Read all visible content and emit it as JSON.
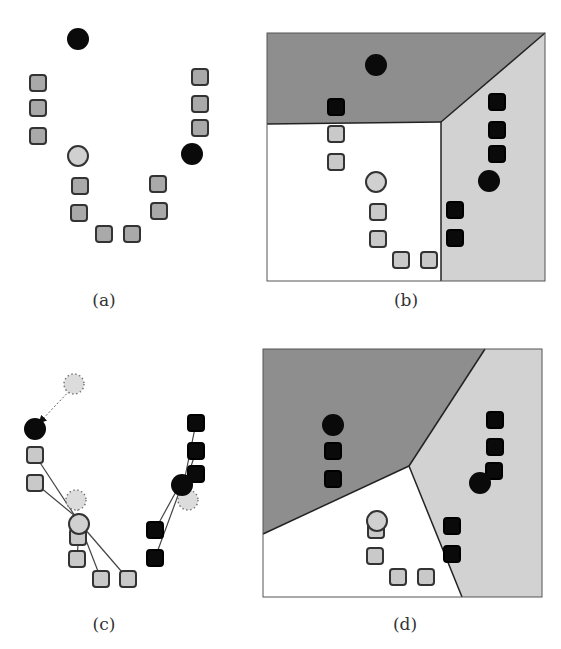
{
  "colors": {
    "dark_region": "#8e8e8e",
    "light_region": "#d2d2d2",
    "white_region": "#ffffff",
    "black_point": "#0a0a0a",
    "gray_square_a": "#a9a9a9",
    "light_square": "#c9c9c9",
    "light_circle": "#d0d0d0",
    "outline": "#333333"
  },
  "panels": [
    {
      "id": "a",
      "caption": "(a)",
      "caption_pos": [
        104,
        300
      ],
      "regions": [],
      "points": [
        {
          "shape": "circle",
          "style": "black",
          "x": 78,
          "y": 39
        },
        {
          "shape": "square",
          "style": "gray",
          "x": 38,
          "y": 83
        },
        {
          "shape": "square",
          "style": "gray",
          "x": 38,
          "y": 108
        },
        {
          "shape": "square",
          "style": "gray",
          "x": 38,
          "y": 136
        },
        {
          "shape": "circle",
          "style": "light",
          "x": 78,
          "y": 156
        },
        {
          "shape": "square",
          "style": "gray",
          "x": 80,
          "y": 186
        },
        {
          "shape": "square",
          "style": "gray",
          "x": 79,
          "y": 213
        },
        {
          "shape": "square",
          "style": "gray",
          "x": 104,
          "y": 234
        },
        {
          "shape": "square",
          "style": "gray",
          "x": 132,
          "y": 234
        },
        {
          "shape": "square",
          "style": "gray",
          "x": 158,
          "y": 184
        },
        {
          "shape": "square",
          "style": "gray",
          "x": 159,
          "y": 211
        },
        {
          "shape": "square",
          "style": "gray",
          "x": 200,
          "y": 77
        },
        {
          "shape": "square",
          "style": "gray",
          "x": 200,
          "y": 104
        },
        {
          "shape": "square",
          "style": "gray",
          "x": 200,
          "y": 128
        },
        {
          "shape": "circle",
          "style": "black",
          "x": 192,
          "y": 154
        }
      ],
      "lines": []
    },
    {
      "id": "b",
      "caption": "(b)",
      "caption_pos": [
        406,
        300
      ],
      "box": [
        267,
        33,
        545,
        281
      ],
      "regions": [
        {
          "fill": "dark",
          "points": [
            [
              267,
              33
            ],
            [
              545,
              33
            ],
            [
              441,
              122
            ],
            [
              267,
              124
            ]
          ]
        },
        {
          "fill": "light",
          "points": [
            [
              441,
              122
            ],
            [
              545,
              33
            ],
            [
              545,
              281
            ],
            [
              441,
              281
            ]
          ]
        }
      ],
      "borders": [
        [
          [
            267,
            124
          ],
          [
            441,
            122
          ]
        ],
        [
          [
            441,
            122
          ],
          [
            545,
            33
          ]
        ],
        [
          [
            441,
            122
          ],
          [
            441,
            281
          ]
        ]
      ],
      "points": [
        {
          "shape": "circle",
          "style": "black",
          "x": 376,
          "y": 65
        },
        {
          "shape": "square",
          "style": "black",
          "x": 336,
          "y": 107
        },
        {
          "shape": "square",
          "style": "light",
          "x": 336,
          "y": 134
        },
        {
          "shape": "square",
          "style": "light",
          "x": 336,
          "y": 162
        },
        {
          "shape": "circle",
          "style": "light",
          "x": 376,
          "y": 182
        },
        {
          "shape": "square",
          "style": "light",
          "x": 378,
          "y": 212
        },
        {
          "shape": "square",
          "style": "light",
          "x": 378,
          "y": 239
        },
        {
          "shape": "square",
          "style": "light",
          "x": 401,
          "y": 260
        },
        {
          "shape": "square",
          "style": "light",
          "x": 429,
          "y": 260
        },
        {
          "shape": "square",
          "style": "black",
          "x": 497,
          "y": 102
        },
        {
          "shape": "square",
          "style": "black",
          "x": 497,
          "y": 130
        },
        {
          "shape": "square",
          "style": "black",
          "x": 497,
          "y": 154
        },
        {
          "shape": "circle",
          "style": "black",
          "x": 489,
          "y": 181
        },
        {
          "shape": "square",
          "style": "black",
          "x": 455,
          "y": 210
        },
        {
          "shape": "square",
          "style": "black",
          "x": 455,
          "y": 238
        }
      ],
      "lines": []
    },
    {
      "id": "c",
      "caption": "(c)",
      "caption_pos": [
        104,
        624
      ],
      "regions": [],
      "points": [
        {
          "shape": "circle",
          "style": "dotted",
          "x": 74,
          "y": 384
        },
        {
          "shape": "circle",
          "style": "black",
          "x": 35,
          "y": 429
        },
        {
          "shape": "square",
          "style": "light",
          "x": 35,
          "y": 455
        },
        {
          "shape": "square",
          "style": "light",
          "x": 35,
          "y": 483
        },
        {
          "shape": "circle",
          "style": "dotted",
          "x": 76,
          "y": 500
        },
        {
          "shape": "square",
          "style": "light",
          "x": 78,
          "y": 537
        },
        {
          "shape": "circle",
          "style": "light",
          "x": 79,
          "y": 524
        },
        {
          "shape": "square",
          "style": "light",
          "x": 77,
          "y": 559
        },
        {
          "shape": "square",
          "style": "light",
          "x": 101,
          "y": 579
        },
        {
          "shape": "square",
          "style": "light",
          "x": 128,
          "y": 579
        },
        {
          "shape": "square",
          "style": "black",
          "x": 196,
          "y": 423
        },
        {
          "shape": "square",
          "style": "black",
          "x": 196,
          "y": 451
        },
        {
          "shape": "square",
          "style": "black",
          "x": 196,
          "y": 474
        },
        {
          "shape": "circle",
          "style": "dotted",
          "x": 188,
          "y": 500
        },
        {
          "shape": "circle",
          "style": "black",
          "x": 182,
          "y": 485
        },
        {
          "shape": "square",
          "style": "black",
          "x": 155,
          "y": 530
        },
        {
          "shape": "square",
          "style": "black",
          "x": 155,
          "y": 558
        }
      ],
      "lines": [
        {
          "from": [
            35,
            455
          ],
          "to": [
            75,
            516
          ]
        },
        {
          "from": [
            35,
            483
          ],
          "to": [
            75,
            516
          ]
        },
        {
          "from": [
            77,
            559
          ],
          "to": [
            79,
            530
          ]
        },
        {
          "from": [
            101,
            579
          ],
          "to": [
            82,
            530
          ]
        },
        {
          "from": [
            128,
            579
          ],
          "to": [
            84,
            528
          ]
        },
        {
          "from": [
            196,
            423
          ],
          "to": [
            184,
            482
          ]
        },
        {
          "from": [
            196,
            451
          ],
          "to": [
            186,
            482
          ]
        },
        {
          "from": [
            196,
            474
          ],
          "to": [
            186,
            484
          ]
        },
        {
          "from": [
            155,
            530
          ],
          "to": [
            178,
            488
          ]
        },
        {
          "from": [
            155,
            558
          ],
          "to": [
            180,
            490
          ]
        }
      ],
      "arrows": [
        {
          "from": [
            72,
            388
          ],
          "to": [
            40,
            422
          ],
          "style": "dotted"
        },
        {
          "from": [
            77,
            505
          ],
          "to": [
            79,
            520
          ],
          "style": "dotted"
        }
      ]
    },
    {
      "id": "d",
      "caption": "(d)",
      "caption_pos": [
        405,
        624
      ],
      "box": [
        263,
        349,
        542,
        597
      ],
      "regions": [
        {
          "fill": "dark",
          "points": [
            [
              263,
              349
            ],
            [
              485,
              349
            ],
            [
              409,
              466
            ],
            [
              263,
              534
            ]
          ]
        },
        {
          "fill": "light",
          "points": [
            [
              485,
              349
            ],
            [
              542,
              349
            ],
            [
              542,
              597
            ],
            [
              462,
              597
            ],
            [
              409,
              466
            ]
          ]
        }
      ],
      "borders": [
        [
          [
            263,
            534
          ],
          [
            409,
            466
          ]
        ],
        [
          [
            409,
            466
          ],
          [
            485,
            349
          ]
        ],
        [
          [
            409,
            466
          ],
          [
            462,
            597
          ]
        ]
      ],
      "points": [
        {
          "shape": "circle",
          "style": "black",
          "x": 333,
          "y": 425
        },
        {
          "shape": "square",
          "style": "black",
          "x": 333,
          "y": 451
        },
        {
          "shape": "square",
          "style": "black",
          "x": 333,
          "y": 479
        },
        {
          "shape": "square",
          "style": "light",
          "x": 376,
          "y": 530
        },
        {
          "shape": "circle",
          "style": "light",
          "x": 377,
          "y": 521
        },
        {
          "shape": "square",
          "style": "light",
          "x": 375,
          "y": 556
        },
        {
          "shape": "square",
          "style": "light",
          "x": 398,
          "y": 577
        },
        {
          "shape": "square",
          "style": "light",
          "x": 426,
          "y": 577
        },
        {
          "shape": "square",
          "style": "black",
          "x": 495,
          "y": 420
        },
        {
          "shape": "square",
          "style": "black",
          "x": 495,
          "y": 447
        },
        {
          "shape": "square",
          "style": "black",
          "x": 494,
          "y": 471
        },
        {
          "shape": "circle",
          "style": "black",
          "x": 480,
          "y": 483
        },
        {
          "shape": "square",
          "style": "black",
          "x": 452,
          "y": 526
        },
        {
          "shape": "square",
          "style": "black",
          "x": 452,
          "y": 554
        }
      ],
      "lines": []
    }
  ]
}
